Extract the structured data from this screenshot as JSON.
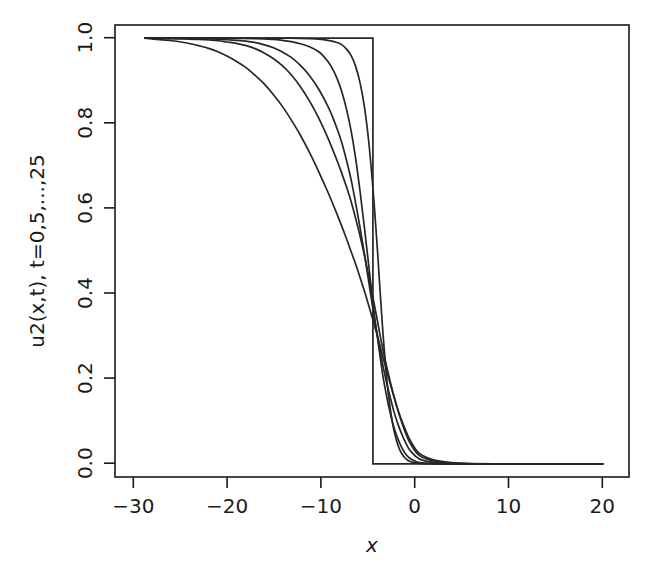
{
  "figure": {
    "background_color": "#ffffff",
    "line_color": "#262626",
    "axis_color": "#1a1a1a"
  },
  "chart_data": {
    "type": "line",
    "title": "",
    "subtitle": "",
    "xlabel": "x",
    "ylabel": "u2(x,t), t=0,5,...,25",
    "xlim": [
      -30,
      20
    ],
    "ylim": [
      0.0,
      1.0
    ],
    "xticks": [
      -30,
      -20,
      -10,
      0,
      10,
      20
    ],
    "xticklabels": [
      "−30",
      "−20",
      "−10",
      "0",
      "10",
      "20"
    ],
    "yticks": [
      0.0,
      0.2,
      0.4,
      0.6,
      0.8,
      1.0
    ],
    "yticklabels": [
      "0.0",
      "0.2",
      "0.4",
      "0.6",
      "0.8",
      "1.0"
    ],
    "grid": false,
    "legend": "none",
    "annotations": [],
    "series": [
      {
        "name": "t=0",
        "style": "step",
        "x": [
          -30,
          -5.1,
          -5.1,
          20
        ],
        "values": [
          1.0,
          1.0,
          0.0,
          0.0
        ]
      },
      {
        "name": "t=5",
        "style": "smooth",
        "x": [
          -30,
          -28,
          -26,
          -24,
          -22,
          -20,
          -18,
          -16,
          -14,
          -12,
          -11,
          -10,
          -9,
          -8.5,
          -8,
          -7.5,
          -7,
          -6.5,
          -6,
          -5.5,
          -5,
          -4.6,
          -4.3,
          -4,
          -3.7,
          -3.4,
          -3,
          -2.6,
          -2.2,
          -1.8,
          -1.4,
          -1,
          0,
          2,
          5,
          10,
          15,
          20
        ],
        "values": [
          1.0,
          1.0,
          1.0,
          1.0,
          1.0,
          1.0,
          1.0,
          1.0,
          1.0,
          0.999,
          0.998,
          0.995,
          0.99,
          0.985,
          0.975,
          0.96,
          0.935,
          0.895,
          0.835,
          0.745,
          0.62,
          0.5,
          0.4,
          0.305,
          0.225,
          0.16,
          0.1,
          0.06,
          0.034,
          0.019,
          0.01,
          0.005,
          0.0008,
          0.0,
          0.0,
          0.0,
          0.0,
          0.0
        ]
      },
      {
        "name": "t=10",
        "style": "smooth",
        "x": [
          -30,
          -28,
          -26,
          -24,
          -22,
          -20,
          -18,
          -16,
          -15,
          -14,
          -13,
          -12,
          -11,
          -10.5,
          -10,
          -9.5,
          -9,
          -8.5,
          -8,
          -7.5,
          -7,
          -6.5,
          -6,
          -5.5,
          -5,
          -4.6,
          -4.3,
          -4,
          -3.6,
          -3.2,
          -2.8,
          -2.4,
          -2,
          -1.5,
          -1,
          0,
          2,
          5,
          10,
          15,
          20
        ],
        "values": [
          1.0,
          1.0,
          1.0,
          1.0,
          1.0,
          0.9995,
          0.999,
          0.997,
          0.995,
          0.992,
          0.987,
          0.98,
          0.968,
          0.958,
          0.945,
          0.928,
          0.905,
          0.875,
          0.835,
          0.785,
          0.72,
          0.64,
          0.55,
          0.455,
          0.36,
          0.295,
          0.25,
          0.205,
          0.158,
          0.118,
          0.085,
          0.06,
          0.04,
          0.022,
          0.012,
          0.003,
          0.0005,
          0.0,
          0.0,
          0.0,
          0.0
        ]
      },
      {
        "name": "t=15",
        "style": "smooth",
        "x": [
          -30,
          -28,
          -26,
          -24,
          -22,
          -20,
          -19,
          -18,
          -17,
          -16,
          -15,
          -14,
          -13,
          -12,
          -11,
          -10,
          -9.5,
          -9,
          -8.5,
          -8,
          -7.5,
          -7,
          -6.5,
          -6,
          -5.5,
          -5,
          -4.6,
          -4.3,
          -4,
          -3.6,
          -3.2,
          -2.8,
          -2.4,
          -2,
          -1.5,
          -1,
          0,
          2,
          5,
          10,
          15,
          20
        ],
        "values": [
          1.0,
          1.0,
          0.9995,
          0.999,
          0.9975,
          0.995,
          0.993,
          0.99,
          0.985,
          0.978,
          0.968,
          0.955,
          0.936,
          0.912,
          0.88,
          0.84,
          0.815,
          0.787,
          0.755,
          0.715,
          0.67,
          0.615,
          0.555,
          0.49,
          0.42,
          0.35,
          0.3,
          0.265,
          0.23,
          0.19,
          0.155,
          0.122,
          0.095,
          0.072,
          0.048,
          0.03,
          0.011,
          0.002,
          0.0,
          0.0,
          0.0,
          0.0
        ]
      },
      {
        "name": "t=20",
        "style": "smooth",
        "x": [
          -30,
          -28,
          -26,
          -24,
          -22,
          -21,
          -20,
          -19,
          -18,
          -17,
          -16,
          -15,
          -14,
          -13,
          -12,
          -11,
          -10,
          -9,
          -8.5,
          -8,
          -7.5,
          -7,
          -6.5,
          -6,
          -5.5,
          -5,
          -4.6,
          -4.3,
          -4,
          -3.6,
          -3.2,
          -2.8,
          -2.4,
          -2,
          -1.5,
          -1,
          0,
          2,
          5,
          10,
          15,
          20
        ],
        "values": [
          1.0,
          0.9993,
          0.9985,
          0.997,
          0.994,
          0.991,
          0.988,
          0.983,
          0.976,
          0.966,
          0.953,
          0.936,
          0.914,
          0.886,
          0.852,
          0.812,
          0.765,
          0.712,
          0.683,
          0.652,
          0.618,
          0.578,
          0.535,
          0.487,
          0.435,
          0.38,
          0.335,
          0.3,
          0.268,
          0.228,
          0.192,
          0.158,
          0.127,
          0.1,
          0.07,
          0.047,
          0.019,
          0.005,
          0.0004,
          0.0,
          0.0,
          0.0
        ]
      },
      {
        "name": "t=25",
        "style": "smooth",
        "x": [
          -30,
          -29,
          -28,
          -27,
          -26,
          -25,
          -24,
          -23,
          -22,
          -21,
          -20,
          -19,
          -18,
          -17,
          -16,
          -15,
          -14,
          -13,
          -12,
          -11,
          -10,
          -9,
          -8,
          -7.5,
          -7,
          -6.5,
          -6,
          -5.5,
          -5,
          -4.6,
          -4.3,
          -4,
          -3.6,
          -3.2,
          -2.8,
          -2.4,
          -2,
          -1.5,
          -1,
          0,
          2,
          5,
          10,
          15,
          20
        ],
        "values": [
          1.0,
          0.998,
          0.996,
          0.994,
          0.991,
          0.987,
          0.982,
          0.976,
          0.968,
          0.958,
          0.946,
          0.932,
          0.914,
          0.894,
          0.869,
          0.841,
          0.808,
          0.772,
          0.731,
          0.686,
          0.638,
          0.586,
          0.53,
          0.5,
          0.47,
          0.438,
          0.404,
          0.368,
          0.33,
          0.3,
          0.275,
          0.25,
          0.218,
          0.187,
          0.157,
          0.129,
          0.104,
          0.077,
          0.054,
          0.024,
          0.007,
          0.0008,
          0.0,
          0.0,
          0.0
        ]
      }
    ]
  },
  "geometry": {
    "plot_left": 115,
    "plot_right": 629,
    "plot_top": 25,
    "plot_bottom": 477,
    "x_axis_min": -33.2,
    "x_axis_max": 22.8,
    "y_axis_min": -0.031,
    "y_axis_max": 1.031
  }
}
